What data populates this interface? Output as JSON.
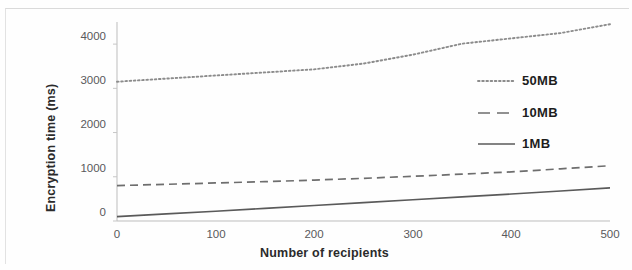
{
  "chart_data": {
    "type": "line",
    "title": "",
    "xlabel": "Number of recipients",
    "ylabel": "Encryption time (ms)",
    "xlim": [
      0,
      500
    ],
    "ylim": [
      0,
      4500
    ],
    "grid": false,
    "legend_position": "center-right",
    "xticks": [
      "0",
      "100",
      "200",
      "300",
      "400",
      "500"
    ],
    "xtick_values": [
      0,
      100,
      200,
      300,
      400,
      500
    ],
    "yticks": [
      "0",
      "1000",
      "2000",
      "3000",
      "4000"
    ],
    "ytick_values": [
      0,
      1000,
      2000,
      3000,
      4000
    ],
    "x": [
      0,
      50,
      100,
      150,
      200,
      250,
      300,
      350,
      400,
      450,
      500
    ],
    "series": [
      {
        "name": "50MB",
        "style": "dotted",
        "color": "#8c8c8c",
        "values": [
          3150,
          3220,
          3290,
          3360,
          3430,
          3560,
          3760,
          4010,
          4130,
          4250,
          4450
        ]
      },
      {
        "name": "10MB",
        "style": "dashed",
        "color": "#6e6e6e",
        "values": [
          800,
          830,
          860,
          890,
          925,
          965,
          1010,
          1060,
          1110,
          1180,
          1250
        ]
      },
      {
        "name": "1MB",
        "style": "solid",
        "color": "#5a5a5a",
        "values": [
          100,
          160,
          220,
          285,
          350,
          415,
          480,
          545,
          610,
          680,
          750
        ]
      }
    ]
  },
  "legend": {
    "entries": [
      {
        "label": "50MB"
      },
      {
        "label": "10MB"
      },
      {
        "label": "1MB"
      }
    ]
  },
  "axes": {
    "x_title": "Number of recipients",
    "y_title": "Encryption time (ms)"
  }
}
